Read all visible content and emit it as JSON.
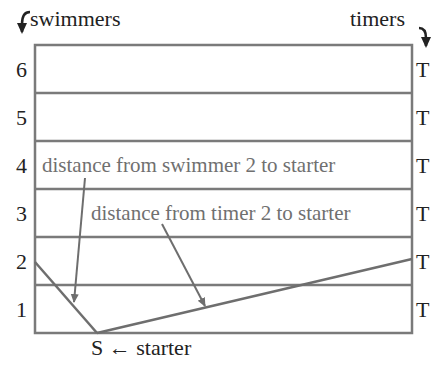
{
  "labels": {
    "swimmers": "swimmers",
    "timers": "timers",
    "starter_label": "S ← starter",
    "swimmer_distance": "distance from swimmer 2 to starter",
    "timer_distance": "distance from timer 2 to starter"
  },
  "lanes": [
    {
      "number": "6",
      "timer": "T"
    },
    {
      "number": "5",
      "timer": "T"
    },
    {
      "number": "4",
      "timer": "T"
    },
    {
      "number": "3",
      "timer": "T"
    },
    {
      "number": "2",
      "timer": "T"
    },
    {
      "number": "1",
      "timer": "T"
    }
  ],
  "colors": {
    "lines": "#7a7a7a",
    "text": "#222222",
    "annotation_text": "#707070"
  }
}
